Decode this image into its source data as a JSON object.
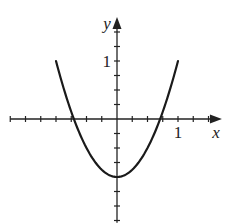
{
  "chart_data": {
    "type": "line",
    "title": "",
    "xlabel": "x",
    "ylabel": "y",
    "xlim": [
      -1.75,
      1.72
    ],
    "ylim": [
      -1.79,
      1.76
    ],
    "x_tick_step": 0.25,
    "y_tick_step": 0.25,
    "x_tick_labels": [
      {
        "value": 1,
        "label": "1"
      }
    ],
    "y_tick_labels": [
      {
        "value": 1,
        "label": "1"
      }
    ],
    "grid": false,
    "series": [
      {
        "name": "y = 2x^2 - 1",
        "function": "2*x*x - 1",
        "domain": [
          -1,
          1
        ],
        "x": [
          -1,
          -0.75,
          -0.5,
          -0.25,
          0,
          0.25,
          0.5,
          0.75,
          1
        ],
        "values": [
          1,
          0.125,
          -0.5,
          -0.875,
          -1,
          -0.875,
          -0.5,
          0.125,
          1
        ],
        "color": "#1a1a1a"
      }
    ],
    "annotations": {
      "vertex": [
        0,
        -1
      ],
      "x_intercepts": [
        -0.707,
        0.707
      ]
    }
  }
}
